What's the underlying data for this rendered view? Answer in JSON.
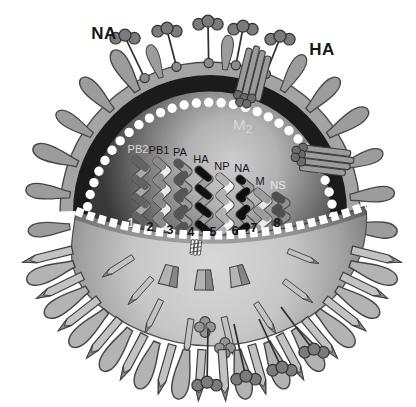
{
  "labels": {
    "na_surface": "NA",
    "ha_surface": "HA",
    "m2_main": "M",
    "m2_sub": "2"
  },
  "segments": [
    {
      "number": "1",
      "label": "PB2",
      "label_color": "#d8d8d8",
      "number_color": "#dcdcdc",
      "base": "#a8a8a8",
      "stripe": "#636363"
    },
    {
      "number": "2",
      "label": "PB1",
      "label_color": "#161616",
      "number_color": "#161616",
      "base": "#ececec",
      "stripe": "#8a8a8a"
    },
    {
      "number": "3",
      "label": "PA",
      "label_color": "#161616",
      "number_color": "#161616",
      "base": "#9b9b9b",
      "stripe": "#555555"
    },
    {
      "number": "4",
      "label": "HA",
      "label_color": "#161616",
      "number_color": "#161616",
      "base": "#a0a0a0",
      "stripe": "#101010"
    },
    {
      "number": "5",
      "label": "NP",
      "label_color": "#161616",
      "number_color": "#161616",
      "base": "#f4f4f4",
      "stripe": "#b2b2b2"
    },
    {
      "number": "6",
      "label": "NA",
      "label_color": "#161616",
      "number_color": "#161616",
      "base": "#9f9f9f",
      "stripe": "#0f0f0f"
    },
    {
      "number": "7",
      "label": "M",
      "label_color": "#161616",
      "number_color": "#161616",
      "base": "#e9e9e9",
      "stripe": "#9d9d9d"
    },
    {
      "number": "8",
      "label": "NS",
      "label_color": "#e6e6e6",
      "number_color": "#161616",
      "base": "#8f8f8f",
      "stripe": "#4f4f4f"
    }
  ],
  "colors": {
    "background": "#ffffff",
    "membrane": "#a4a4a4",
    "membrane_outline": "#4d4d4d",
    "matrix_ring": "#1b1b1b",
    "lipid_beads": "#ffffff",
    "core_glow": "#cdcdcd",
    "core_edge": "#383838",
    "bowl_light": "#d8d8d8",
    "bowl_edge": "#858585",
    "spike_upper": "#9c9c9c",
    "spike_lower": "#b3b3b3",
    "rod_shaft": "#c2c2c2",
    "na_ball": "#7b7b7b",
    "m2_rod": "#9b9b9b",
    "label_dark": "#161616",
    "label_light": "#d8d8d8"
  }
}
